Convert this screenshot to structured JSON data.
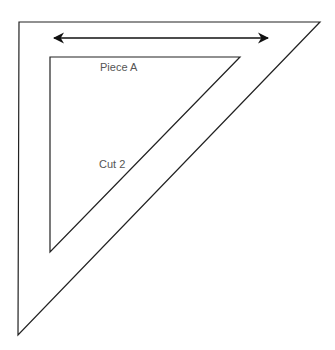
{
  "diagram": {
    "stroke_color": "#222222",
    "text_color": "#555555",
    "background": "#ffffff",
    "outer_triangle": {
      "points": [
        [
          19,
          22
        ],
        [
          320,
          22
        ],
        [
          18,
          335
        ]
      ]
    },
    "inner_triangle": {
      "points": [
        [
          50,
          57
        ],
        [
          240,
          57
        ],
        [
          50,
          252
        ]
      ]
    },
    "arrow": {
      "from": [
        54,
        38
      ],
      "to": [
        268,
        38
      ],
      "type": "double-headed"
    },
    "labels": [
      {
        "id": "piece-a",
        "text": "Piece A",
        "x": 100,
        "y": 62
      },
      {
        "id": "cut-2",
        "text": "Cut 2",
        "x": 99,
        "y": 159
      }
    ]
  }
}
